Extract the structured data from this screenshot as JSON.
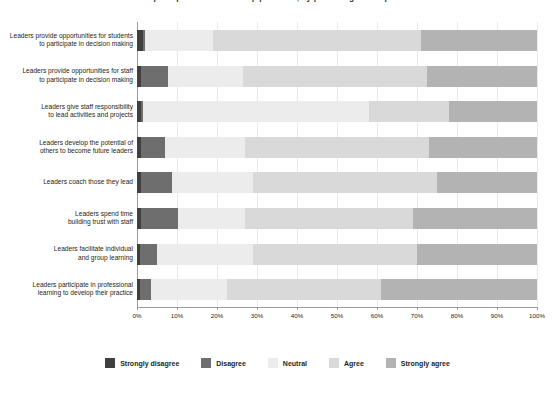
{
  "chart_data": {
    "type": "bar",
    "subtype": "stacked-horizontal-100-percent",
    "title": "Staff perceptions of leadership practices, by percentage of respondents",
    "xlabel": "",
    "ylabel": "",
    "xlim": [
      0,
      100
    ],
    "xticks": [
      "0%",
      "10%",
      "20%",
      "30%",
      "40%",
      "50%",
      "60%",
      "70%",
      "80%",
      "90%",
      "100%"
    ],
    "grid": true,
    "legend_position": "bottom",
    "categories": [
      "Leaders provide opportunities for students to participate in decision making",
      "Leaders provide opportunities for staff to participate in decision making",
      "Leaders give staff responsibility to lead activities and projects",
      "Leaders develop the potential of others to become future leaders",
      "Leaders coach those they lead",
      "Leaders spend time building trust with staff",
      "Leaders facilitate individual and group learning",
      "Leaders participate in professional learning to develop their practice"
    ],
    "categories_lines": [
      [
        "Leaders provide opportunities for students",
        "to participate in decision making"
      ],
      [
        "Leaders provide opportunities for staff",
        "to participate in decision making"
      ],
      [
        "Leaders give staff responsibility",
        "to lead activities and projects"
      ],
      [
        "Leaders develop the potential of",
        "others to become future leaders"
      ],
      [
        "Leaders coach those they lead"
      ],
      [
        "Leaders spend time",
        "building trust with staff"
      ],
      [
        "Leaders facilitate individual",
        "and group learning"
      ],
      [
        "Leaders participate in professional",
        "learning to develop their practice"
      ]
    ],
    "series": [
      {
        "name": "Strongly disagree",
        "color": "#3f3f3f",
        "values": [
          1.5,
          1.0,
          1.0,
          1.0,
          1.0,
          1.0,
          0.8,
          0.8
        ]
      },
      {
        "name": "Disagree",
        "color": "#6e6e6e",
        "values": [
          0.5,
          6.8,
          0.5,
          6.0,
          7.7,
          9.2,
          4.2,
          2.7
        ]
      },
      {
        "name": "Neutral",
        "color": "#ececec",
        "values": [
          17.0,
          18.7,
          56.5,
          20.0,
          20.3,
          16.8,
          24.0,
          19.0
        ]
      },
      {
        "name": "Agree",
        "color": "#d9d9d9",
        "values": [
          52.0,
          46.0,
          20.0,
          46.0,
          46.0,
          42.0,
          41.0,
          38.5
        ]
      },
      {
        "name": "Strongly agree",
        "color": "#b3b3b3",
        "values": [
          29.0,
          27.5,
          22.0,
          27.0,
          25.0,
          31.0,
          30.0,
          39.0
        ]
      }
    ]
  },
  "legend": {
    "items": [
      {
        "label": "Strongly disagree",
        "color": "#3f3f3f"
      },
      {
        "label": "Disagree",
        "color": "#6e6e6e"
      },
      {
        "label": "Neutral",
        "color": "#ececec"
      },
      {
        "label": "Agree",
        "color": "#d9d9d9"
      },
      {
        "label": "Strongly agree",
        "color": "#b3b3b3"
      }
    ]
  }
}
